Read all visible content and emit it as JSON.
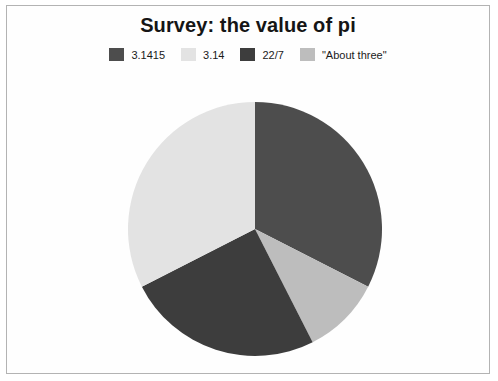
{
  "chart": {
    "title": "Survey: the value of pi",
    "background_color": "#fefefe",
    "border_color": "#b3b3b3",
    "title_color": "#151515"
  },
  "legend": {
    "position": "top",
    "items": [
      {
        "label": "3.1415",
        "color": "#4d4d4d"
      },
      {
        "label": "3.14",
        "color": "#e3e3e3"
      },
      {
        "label": "22/7",
        "color": "#3d3d3d"
      },
      {
        "label": "\"About three\"",
        "color": "#bdbdbd"
      }
    ]
  },
  "chart_data": {
    "type": "pie",
    "title": "Survey: the value of pi",
    "xlabel": "",
    "ylabel": "",
    "categories": [
      "3.1415",
      "3.14",
      "22/7",
      "\"About three\""
    ],
    "values": [
      32.5,
      32.5,
      25.0,
      10.0
    ],
    "units": "percent",
    "colors": [
      "#4d4d4d",
      "#e3e3e3",
      "#3d3d3d",
      "#bdbdbd"
    ],
    "start_angle_deg": 0,
    "direction": "clockwise",
    "legend_position": "top",
    "grid": false,
    "slices": [
      {
        "label": "3.1415",
        "value": 32.5,
        "color": "#4d4d4d",
        "start_deg": 0,
        "end_deg": 117
      },
      {
        "label": "\"About three\"",
        "value": 10.0,
        "color": "#bdbdbd",
        "start_deg": 117,
        "end_deg": 153
      },
      {
        "label": "22/7",
        "value": 25.0,
        "color": "#3d3d3d",
        "start_deg": 153,
        "end_deg": 243
      },
      {
        "label": "3.14",
        "value": 32.5,
        "color": "#e3e3e3",
        "start_deg": 243,
        "end_deg": 360
      }
    ],
    "geometry": {
      "center_x": 130,
      "center_y": 130,
      "radius": 127
    }
  }
}
